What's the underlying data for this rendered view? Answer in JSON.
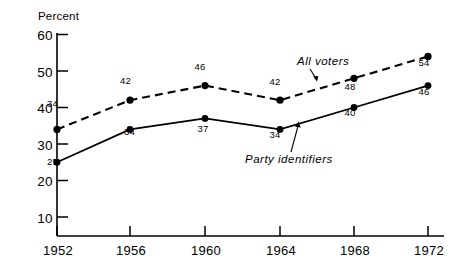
{
  "chart_data": {
    "type": "line",
    "title": "",
    "subtitle": "",
    "xlabel": "",
    "ylabel": "Percent",
    "categories": [
      "1952",
      "1956",
      "1960",
      "1964",
      "1968",
      "1972"
    ],
    "x": [
      1952,
      1956,
      1960,
      1964,
      1968,
      1972
    ],
    "xlim": [
      1950,
      1974
    ],
    "ylim": [
      0,
      60
    ],
    "y_ticks": [
      10,
      20,
      30,
      40,
      50,
      60
    ],
    "y_tick_labels": [
      "10",
      "20",
      "30",
      "40",
      "50",
      "60"
    ],
    "x_ticks": [
      1952,
      1956,
      1960,
      1964,
      1968,
      1972
    ],
    "x_tick_labels": [
      "1952",
      "1956",
      "1960",
      "1964",
      "1968",
      "1972"
    ],
    "grid": false,
    "legend_position": "inline-annotation",
    "series": [
      {
        "name": "All voters",
        "style": "dashed",
        "marker": "filled-circle",
        "values": [
          34,
          42,
          46,
          42,
          48,
          54
        ],
        "data_labels": [
          "34",
          "42",
          "46",
          "42",
          "48",
          "54"
        ]
      },
      {
        "name": "Party identifiers",
        "style": "solid",
        "marker": "filled-circle",
        "values": [
          25,
          34,
          37,
          34,
          40,
          46
        ],
        "data_labels": [
          "25",
          "34",
          "37",
          "34",
          "40",
          "46"
        ]
      }
    ],
    "annotations": [
      {
        "text": "All voters",
        "target_series": "All voters",
        "arrow": true
      },
      {
        "text": "Party identifiers",
        "target_series": "Party identifiers",
        "arrow": true
      }
    ]
  },
  "axis": {
    "y_title": "Percent",
    "y_labels": [
      "60",
      "50",
      "40",
      "30",
      "20",
      "10"
    ],
    "x_labels": [
      "1952",
      "1956",
      "1960",
      "1964",
      "1968",
      "1972"
    ]
  },
  "labels": {
    "all_voters": {
      "name": "All voters",
      "points": [
        "34",
        "42",
        "46",
        "42",
        "48",
        "54"
      ]
    },
    "party_identifiers": {
      "name": "Party identifiers",
      "points": [
        "25",
        "34",
        "37",
        "34",
        "40",
        "46"
      ]
    }
  },
  "colors": {
    "ink": "#000000",
    "background": "#ffffff"
  }
}
